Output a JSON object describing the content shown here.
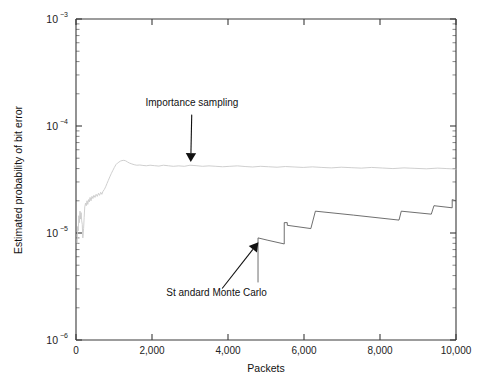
{
  "chart_data": {
    "type": "line",
    "title": "",
    "xlabel": "Packets",
    "ylabel": "Estimated probability of bit error",
    "xlim": [
      0,
      10000
    ],
    "ylim": [
      1e-06,
      0.001
    ],
    "yscale": "log",
    "xscale": "linear",
    "grid": false,
    "legend_position": "none",
    "xticks": [
      0,
      2000,
      4000,
      6000,
      8000,
      10000
    ],
    "xticklabels": [
      "0",
      "2,000",
      "4,000",
      "6,000",
      "8,000",
      "10,000"
    ],
    "yticks": [
      1e-06,
      1e-05,
      0.0001,
      0.001
    ],
    "yticklabels": [
      "10-6",
      "10-5",
      "10-4",
      "10-3"
    ],
    "ytick_base": "10",
    "ytick_exponents": [
      "-3",
      "-4",
      "-5",
      "-6"
    ],
    "series": [
      {
        "name": "Importance sampling",
        "color": "#c9c9c9",
        "x": [
          30,
          45,
          60,
          75,
          90,
          105,
          120,
          135,
          150,
          165,
          180,
          200,
          215,
          230,
          250,
          270,
          290,
          310,
          330,
          350,
          370,
          395,
          420,
          445,
          470,
          500,
          530,
          560,
          590,
          620,
          650,
          680,
          710,
          745,
          780,
          815,
          850,
          890,
          930,
          970,
          1010,
          1050,
          1090,
          1130,
          1170,
          1210,
          1260,
          1310,
          1360,
          1410,
          1470,
          1530,
          1600,
          1680,
          1760,
          1850,
          1950,
          2060,
          2180,
          2300,
          2430,
          2560,
          2700,
          2850,
          3000,
          3160,
          3330,
          3500,
          3680,
          3860,
          4050,
          4250,
          4450,
          4650,
          4860,
          5070,
          5290,
          5510,
          5740,
          5980,
          6220,
          6470,
          6720,
          6980,
          7240,
          7510,
          7780,
          8060,
          8340,
          8630,
          8920,
          9220,
          9520,
          9760,
          10000
        ],
        "y": [
          8e-06,
          1.15e-05,
          1.05e-05,
          1.45e-05,
          1.25e-05,
          1.6e-05,
          1.35e-05,
          1.55e-05,
          1.3e-05,
          1.2e-05,
          9e-06,
          1.1e-05,
          1.4e-05,
          1.75e-05,
          1.9e-05,
          1.8e-05,
          2e-05,
          1.85e-05,
          2.05e-05,
          1.95e-05,
          2.15e-05,
          2e-05,
          2.2e-05,
          2.1e-05,
          2.25e-05,
          2.15e-05,
          2.3e-05,
          2.2e-05,
          2.35e-05,
          2.25e-05,
          2.4e-05,
          2.3e-05,
          2.45e-05,
          2.55e-05,
          2.7e-05,
          2.9e-05,
          3.1e-05,
          3.35e-05,
          3.6e-05,
          3.85e-05,
          4.1e-05,
          4.35e-05,
          4.5e-05,
          4.6e-05,
          4.7e-05,
          4.75e-05,
          4.78e-05,
          4.72e-05,
          4.6e-05,
          4.5e-05,
          4.42e-05,
          4.35e-05,
          4.3e-05,
          4.32e-05,
          4.28e-05,
          4.25e-05,
          4.3e-05,
          4.26e-05,
          4.22e-05,
          4.3e-05,
          4.25e-05,
          4.2e-05,
          4.24e-05,
          4.2e-05,
          4.3e-05,
          4.26e-05,
          4.2e-05,
          4.24e-05,
          4.2e-05,
          4.16e-05,
          4.2e-05,
          4.24e-05,
          4.18e-05,
          4.14e-05,
          4.2e-05,
          4.16e-05,
          4.12e-05,
          4.18e-05,
          4.14e-05,
          4.1e-05,
          4.15e-05,
          4.1e-05,
          4.06e-05,
          4.12e-05,
          4.08e-05,
          4.04e-05,
          4.1e-05,
          4.05e-05,
          4e-05,
          4.06e-05,
          4.02e-05,
          3.98e-05,
          4.04e-05,
          4e-05,
          3.96e-05
        ]
      },
      {
        "name": "Standard Monte Carlo",
        "color": "#4a4a4a",
        "description": "Sawtooth staircase: zero until first error near 4,800 packets, then step increases with slow decay between steps",
        "x": [
          4790,
          4790,
          5050,
          5050,
          5480,
          5480,
          5560,
          5560,
          6180,
          6180,
          6300,
          6300,
          7300,
          7300,
          8500,
          8500,
          8560,
          8560,
          9350,
          9350,
          9420,
          9420,
          9900,
          9900,
          10000
        ],
        "y": [
          3.45e-06,
          9e-06,
          8.55e-06,
          8.55e-06,
          7.9e-06,
          1.25e-05,
          1.25e-05,
          1.18e-05,
          1.1e-05,
          1.1e-05,
          1.6e-05,
          1.6e-05,
          1.47e-05,
          1.47e-05,
          1.32e-05,
          1.32e-05,
          1.6e-05,
          1.6e-05,
          1.5e-05,
          1.5e-05,
          1.8e-05,
          1.8e-05,
          1.72e-05,
          2.05e-05,
          2e-05
        ]
      }
    ],
    "annotations": [
      {
        "text": "Importance sampling",
        "text_x": 3050,
        "text_y": 0.000155,
        "arrow_tip_x": 3020,
        "arrow_tip_y": 4.6e-05
      },
      {
        "text": "St andard Monte Carlo",
        "text_x": 3700,
        "text_y": 2.6e-06,
        "arrow_tip_x": 4800,
        "arrow_tip_y": 8.2e-06
      }
    ]
  }
}
